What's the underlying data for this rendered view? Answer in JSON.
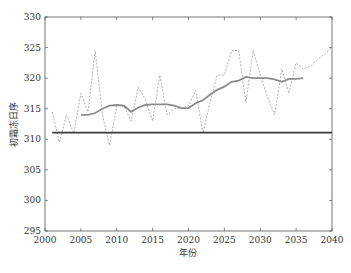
{
  "chart_data": {
    "type": "line",
    "title": "",
    "xlabel": "年份",
    "ylabel": "初霜冻日序",
    "xlim": [
      2000,
      2040
    ],
    "ylim": [
      295,
      330
    ],
    "xticks": [
      2000,
      2005,
      2010,
      2015,
      2020,
      2025,
      2030,
      2035,
      2040
    ],
    "yticks": [
      295,
      300,
      305,
      310,
      315,
      320,
      325,
      330
    ],
    "grid": false,
    "legend": null,
    "series": [
      {
        "name": "annual-first-frost-day",
        "style": "dashed",
        "color": "#9a9a9a",
        "x": [
          2001,
          2002,
          2003,
          2004,
          2005,
          2006,
          2007,
          2008,
          2009,
          2010,
          2011,
          2012,
          2013,
          2014,
          2015,
          2016,
          2017,
          2018,
          2019,
          2020,
          2021,
          2022,
          2023,
          2024,
          2025,
          2026,
          2027,
          2028,
          2029,
          2030,
          2031,
          2032,
          2033,
          2034,
          2035,
          2036,
          2037,
          2038,
          2039,
          2040
        ],
        "values": [
          314.5,
          309.5,
          314,
          311,
          317.5,
          314.5,
          324.5,
          314,
          309,
          315.5,
          315.5,
          313,
          318.5,
          316.5,
          313,
          320.5,
          314,
          315,
          315,
          315.5,
          318,
          311,
          316,
          320.5,
          320.5,
          324.5,
          324.5,
          316,
          324.5,
          320.5,
          317,
          314,
          321.5,
          317.5,
          322.5,
          321.5,
          322,
          323,
          324,
          325
        ]
      },
      {
        "name": "moving-average",
        "style": "solid",
        "color": "#8c8c8c",
        "x": [
          2005,
          2006,
          2007,
          2008,
          2009,
          2010,
          2011,
          2012,
          2013,
          2014,
          2015,
          2016,
          2017,
          2018,
          2019,
          2020,
          2021,
          2022,
          2023,
          2024,
          2025,
          2026,
          2027,
          2028,
          2029,
          2030,
          2031,
          2032,
          2033,
          2034,
          2035,
          2036
        ],
        "values": [
          314,
          314,
          314.3,
          315,
          315.5,
          315.6,
          315.5,
          314.5,
          315.2,
          315.6,
          315.7,
          315.7,
          315.7,
          315.5,
          315.1,
          315.1,
          315.9,
          316.4,
          317.3,
          318.1,
          318.6,
          319.4,
          319.6,
          320.2,
          320,
          320,
          320,
          319.8,
          319.4,
          319.9,
          319.9,
          320
        ]
      },
      {
        "name": "baseline-mean",
        "style": "solid-thick",
        "color": "#3a3a3a",
        "x": [
          2001,
          2040
        ],
        "values": [
          311.1,
          311.1
        ]
      }
    ]
  },
  "axes": {
    "xlabel": "年份",
    "ylabel": "初霜冻日序"
  }
}
